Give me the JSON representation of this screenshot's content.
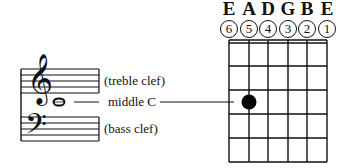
{
  "staff": {
    "treble_label": "(treble clef)",
    "bass_label": "(bass clef)",
    "middle_c_label": "middle C",
    "treble_clef_symbol": "𝄞",
    "bass_clef_symbol": "𝄢"
  },
  "fretboard": {
    "string_names": [
      "E",
      "A",
      "D",
      "G",
      "B",
      "E"
    ],
    "string_numbers": [
      "6",
      "5",
      "4",
      "3",
      "2",
      "1"
    ],
    "frets_shown": 5,
    "dot": {
      "string": 5,
      "fret": 3,
      "color": "#000000"
    }
  }
}
